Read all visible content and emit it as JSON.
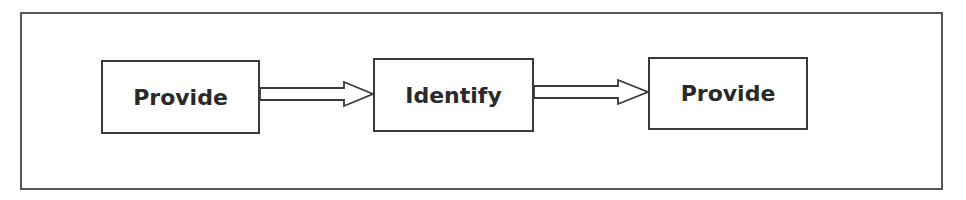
{
  "diagram": {
    "type": "flowchart",
    "direction": "left-to-right",
    "nodes": [
      {
        "id": "n1",
        "label": "Provide"
      },
      {
        "id": "n2",
        "label": "Identify"
      },
      {
        "id": "n3",
        "label": "Provide"
      }
    ],
    "edges": [
      {
        "from": "n1",
        "to": "n2",
        "style": "hollow-block-arrow"
      },
      {
        "from": "n2",
        "to": "n3",
        "style": "hollow-block-arrow"
      }
    ],
    "colors": {
      "stroke": "#3a3a3a",
      "frame": "#555555",
      "text": "#2a2a2a",
      "background": "#ffffff"
    }
  }
}
